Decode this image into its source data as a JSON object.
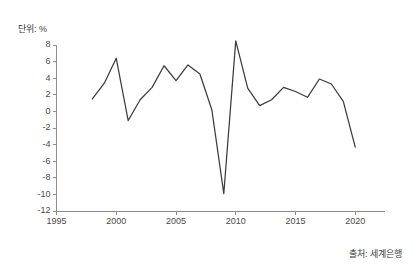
{
  "unit_label": "단위: %",
  "source_label": "출처: 세계은행",
  "chart_data": {
    "type": "line",
    "title": "",
    "subtitle": "",
    "xlabel": "",
    "ylabel": "단위: %",
    "xlim": [
      1995,
      2022.5
    ],
    "ylim": [
      -12,
      8
    ],
    "grid": false,
    "legend": "none",
    "line_color": "#3c3c3c",
    "axis_color": "#8d8d8d",
    "xticks": [
      1995,
      2000,
      2005,
      2010,
      2015,
      2020
    ],
    "xtick_labels": [
      "1995",
      "2000",
      "2005",
      "2010",
      "2015",
      "2020"
    ],
    "yticks": [
      8,
      6,
      4,
      2,
      0,
      -2,
      -4,
      -6,
      -8,
      -10,
      -12
    ],
    "ytick_labels": [
      "8",
      "6",
      "4",
      "2",
      "0",
      "-2",
      "-4",
      "-6",
      "-8",
      "-10",
      "-12"
    ],
    "x": [
      1998,
      1999,
      2000,
      2001,
      2002,
      2003,
      2004,
      2005,
      2006,
      2007,
      2008,
      2009,
      2010,
      2011,
      2012,
      2013,
      2014,
      2015,
      2016,
      2017,
      2018,
      2019,
      2020
    ],
    "series": [
      {
        "name": "경제성장률",
        "values": [
          1.5,
          3.4,
          6.4,
          -1.1,
          1.4,
          2.9,
          5.5,
          3.7,
          5.6,
          4.5,
          0.2,
          -9.9,
          8.5,
          2.8,
          0.7,
          1.4,
          2.9,
          2.4,
          1.7,
          3.9,
          3.3,
          1.2,
          -4.3
        ]
      }
    ]
  }
}
